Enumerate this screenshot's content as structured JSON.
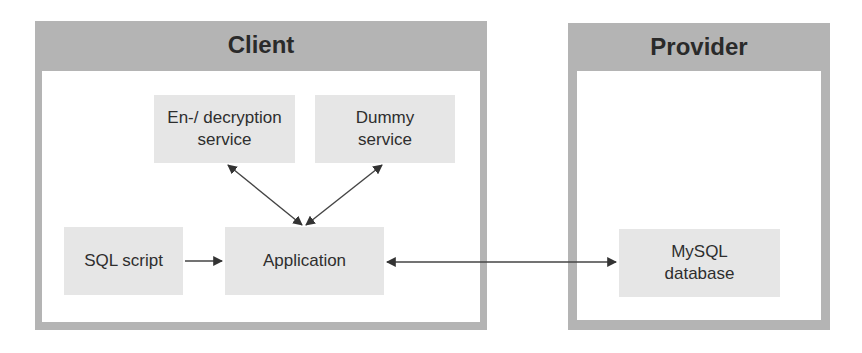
{
  "diagram": {
    "containers": [
      {
        "id": "client",
        "title": "Client"
      },
      {
        "id": "provider",
        "title": "Provider"
      }
    ],
    "nodes": [
      {
        "id": "encdec",
        "label": "En-/ decryption\nservice",
        "container": "client"
      },
      {
        "id": "dummy",
        "label": "Dummy\nservice",
        "container": "client"
      },
      {
        "id": "sqlscript",
        "label": "SQL script",
        "container": "client"
      },
      {
        "id": "application",
        "label": "Application",
        "container": "client"
      },
      {
        "id": "mysql",
        "label": "MySQL\ndatabase",
        "container": "provider"
      }
    ],
    "edges": [
      {
        "from": "encdec",
        "to": "application",
        "direction": "both"
      },
      {
        "from": "dummy",
        "to": "application",
        "direction": "both"
      },
      {
        "from": "sqlscript",
        "to": "application",
        "direction": "forward"
      },
      {
        "from": "application",
        "to": "mysql",
        "direction": "both"
      }
    ],
    "colors": {
      "container_border": "#b4b4b4",
      "node_fill": "#e6e6e6",
      "arrow": "#333333"
    }
  }
}
